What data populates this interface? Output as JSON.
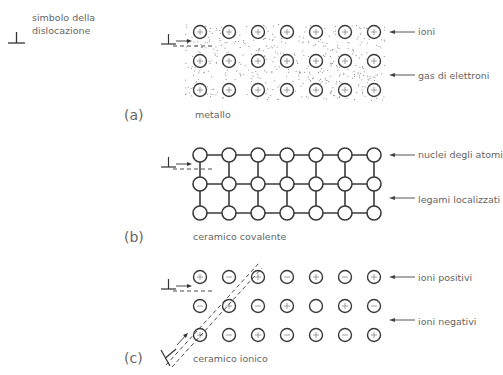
{
  "legend": {
    "symbol_line1": "simbolo della",
    "symbol_line2": "dislocazione",
    "icon": "dislocation-symbol"
  },
  "panels": [
    {
      "id": "a",
      "letter": "(a)",
      "caption": "metallo",
      "labels": [
        "ioni",
        "gas di elettroni"
      ],
      "grid": [
        [
          "+",
          "+",
          "+",
          "+",
          "+",
          "+",
          "+"
        ],
        [
          "+",
          "+",
          "+",
          "+",
          "+",
          "+",
          "+"
        ],
        [
          "+",
          "+",
          "+",
          "+",
          "+",
          "+",
          "+"
        ]
      ]
    },
    {
      "id": "b",
      "letter": "(b)",
      "caption": "ceramico covalente",
      "labels": [
        "nuclei degli atomi",
        "legami localizzati"
      ],
      "grid": [
        [
          "",
          "",
          "",
          "",
          "",
          "",
          ""
        ],
        [
          "",
          "",
          "",
          "",
          "",
          "",
          ""
        ],
        [
          "",
          "",
          "",
          "",
          "",
          "",
          ""
        ]
      ]
    },
    {
      "id": "c",
      "letter": "(c)",
      "caption": "ceramico ionico",
      "labels": [
        "ioni positivi",
        "ioni negativi"
      ],
      "grid": [
        [
          "+",
          "-",
          "+",
          "-",
          "+",
          "-",
          "+"
        ],
        [
          "-",
          "+",
          "-",
          "+",
          "",
          "+",
          "-"
        ],
        [
          "+",
          "-",
          "+",
          "-",
          "+",
          "-",
          "+"
        ]
      ]
    }
  ],
  "colors": {
    "stroke": "#3a3a3a",
    "text": "#666666",
    "dots": "#777777"
  }
}
